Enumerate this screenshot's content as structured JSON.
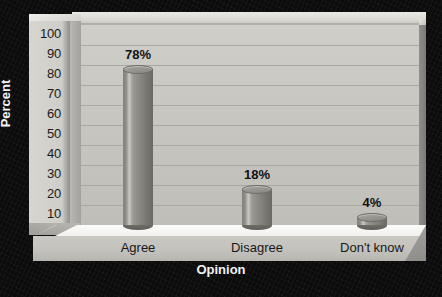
{
  "chart_data": {
    "type": "bar",
    "title": "",
    "subtitle": "",
    "xlabel": "Opinion",
    "ylabel": "Percent",
    "categories": [
      "Agree",
      "Disagree",
      "Don't know"
    ],
    "values": [
      78,
      18,
      4
    ],
    "data_labels": [
      "78%",
      "18%",
      "4%"
    ],
    "ylim": [
      0,
      100
    ],
    "ytick_step": 10,
    "yticks": [
      100,
      90,
      80,
      70,
      60,
      50,
      40,
      30,
      20,
      10,
      0
    ],
    "ytick_labels": [
      "100",
      "90",
      "80",
      "70",
      "60",
      "50",
      "40",
      "30",
      "20",
      "10",
      "0"
    ],
    "grid": true,
    "legend": false,
    "legend_position": "none",
    "style": "3d-cylinder",
    "colors": {
      "background": "#0b0b0b",
      "panel": "#c8c7c2",
      "floor": "#f7f6f3",
      "bar": "#8a8984",
      "gridline": "#a9a8a3",
      "axis_text": "#1a1a1a",
      "title_text": "#f2f2f2"
    }
  }
}
